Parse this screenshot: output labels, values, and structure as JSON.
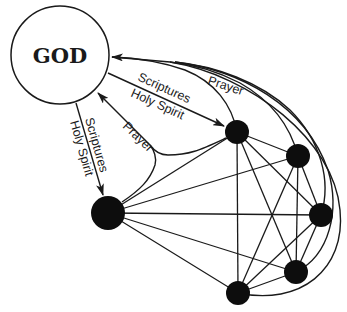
{
  "diagram": {
    "god": {
      "label": "GOD",
      "cx": 60,
      "cy": 55,
      "r": 49
    },
    "labels": {
      "top_scriptures": "Scriptures",
      "top_holy_spirit": "Holy Spirit",
      "top_prayer": "Prayer",
      "mid_prayer": "Prayer",
      "left_scriptures": "Scriptures",
      "left_holy_spirit": "Holy Spirit"
    },
    "nodes": [
      {
        "id": "A",
        "cx": 237,
        "cy": 132,
        "r": 12
      },
      {
        "id": "B",
        "cx": 298,
        "cy": 156,
        "r": 12
      },
      {
        "id": "C",
        "cx": 321,
        "cy": 215,
        "r": 12
      },
      {
        "id": "D",
        "cx": 296,
        "cy": 272,
        "r": 12
      },
      {
        "id": "E",
        "cx": 238,
        "cy": 293,
        "r": 12
      },
      {
        "id": "F",
        "cx": 108,
        "cy": 213,
        "r": 17
      }
    ],
    "colors": {
      "ink": "#1a1a1a",
      "node": "#0d0d0d",
      "background": "#ffffff"
    }
  }
}
